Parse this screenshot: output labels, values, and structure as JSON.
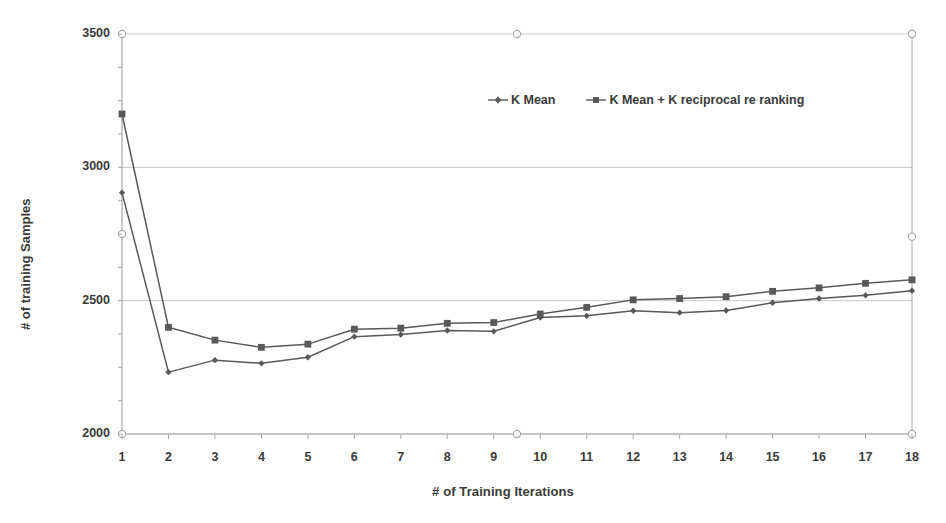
{
  "chart_data": {
    "type": "line",
    "title": "",
    "xlabel": "# of Training Iterations",
    "ylabel": "# of training Samples",
    "xlim": [
      1,
      18
    ],
    "ylim": [
      2000,
      3500
    ],
    "grid": true,
    "legend_position": "top-center",
    "x": [
      1,
      2,
      3,
      4,
      5,
      6,
      7,
      8,
      9,
      10,
      11,
      12,
      13,
      14,
      15,
      16,
      17,
      18
    ],
    "x_tick_labels": [
      "1",
      "2",
      "3",
      "4",
      "5",
      "6",
      "7",
      "8",
      "9",
      "10",
      "11",
      "12",
      "13",
      "14",
      "15",
      "16",
      "17",
      "18"
    ],
    "y_tick_labels": [
      "2000",
      "2500",
      "3000",
      "3500"
    ],
    "y_ticks": [
      2000,
      2500,
      3000,
      3500
    ],
    "series": [
      {
        "name": "K Mean",
        "marker": "diamond",
        "color": "#595959",
        "values": [
          2905,
          2232,
          2277,
          2265,
          2288,
          2365,
          2373,
          2388,
          2385,
          2437,
          2443,
          2462,
          2455,
          2463,
          2492,
          2508,
          2520,
          2537
        ]
      },
      {
        "name": "K Mean + K reciprocal re ranking",
        "marker": "square",
        "color": "#595959",
        "values": [
          3200,
          2400,
          2352,
          2325,
          2337,
          2393,
          2397,
          2415,
          2418,
          2450,
          2475,
          2503,
          2508,
          2515,
          2535,
          2548,
          2565,
          2578
        ]
      }
    ]
  },
  "legend": {
    "items": [
      {
        "label": "K Mean"
      },
      {
        "label": "K Mean + K reciprocal re ranking"
      }
    ]
  },
  "axes": {
    "x_title": "# of Training Iterations",
    "y_title": "# of training Samples"
  },
  "colors": {
    "line": "#595959",
    "grid": "#c9c9c9",
    "axis": "#a6a6a6",
    "text": "#3a3a3a"
  }
}
